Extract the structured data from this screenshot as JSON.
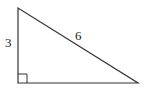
{
  "diagram": {
    "type": "right-triangle",
    "stroke_color": "#333333",
    "vertices": {
      "top": [
        18,
        8
      ],
      "right_angle": [
        18,
        83
      ],
      "bottom_right": [
        138,
        83
      ]
    },
    "right_angle_marker": {
      "at": "bottom-left",
      "size": 9
    },
    "labels": {
      "vertical_leg": "3",
      "hypotenuse": "6"
    }
  }
}
